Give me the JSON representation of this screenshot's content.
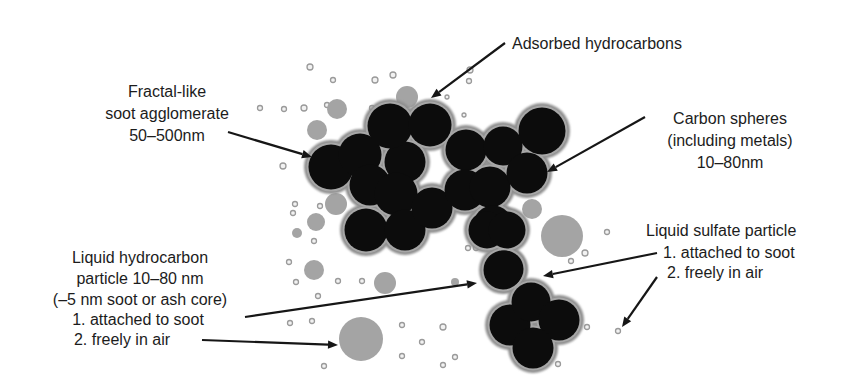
{
  "diagram": {
    "colors": {
      "background": "#ffffff",
      "soot_core": "#0c0c0c",
      "soot_halo": "#8f8f8f",
      "sphere_rim": "#a7a7a7",
      "liquid_particle": "#a4a4a4",
      "small_particle": "#9a9a9a",
      "text": "#1c1c1c",
      "arrow": "#161616"
    },
    "labels": [
      {
        "id": "agglomerate",
        "anchor": "middle",
        "x": 167,
        "lines": [
          {
            "y": 97,
            "text": "Fractal-like"
          },
          {
            "y": 119,
            "text": "soot agglomerate"
          },
          {
            "y": 141,
            "text": "50–500nm"
          }
        ]
      },
      {
        "id": "adsorbed",
        "anchor": "start",
        "x": 512,
        "lines": [
          {
            "y": 49,
            "text": "Adsorbed hydrocarbons"
          }
        ]
      },
      {
        "id": "carbon-spheres",
        "anchor": "middle",
        "x": 730,
        "lines": [
          {
            "y": 124,
            "text": "Carbon spheres"
          },
          {
            "y": 146,
            "text": "(including metals)"
          },
          {
            "y": 168,
            "text": "10–80nm"
          }
        ]
      },
      {
        "id": "sulfate",
        "anchor": "start",
        "x": 646,
        "lines": [
          {
            "y": 236,
            "text": "Liquid sulfate particle"
          },
          {
            "y": 258,
            "text": "1. attached to soot",
            "dx": 17
          },
          {
            "y": 278,
            "text": "2. freely in air",
            "dx": 21
          }
        ]
      },
      {
        "id": "liquid-hydrocarbon",
        "anchor": "middle",
        "x": 140,
        "lines": [
          {
            "y": 263,
            "text": "Liquid hydrocarbon"
          },
          {
            "y": 284,
            "text": "particle 10–80 nm"
          },
          {
            "y": 305,
            "text": "(–5 nm soot or ash core)"
          },
          {
            "y": 325,
            "text": "1. attached to soot",
            "dx": -2
          },
          {
            "y": 345,
            "text": "2. freely in air",
            "dx": -18
          }
        ]
      }
    ],
    "arrows": [
      {
        "id": "to-agglomerate",
        "x1": 228,
        "y1": 132,
        "x2": 312,
        "y2": 157
      },
      {
        "id": "to-adsorbed",
        "x1": 505,
        "y1": 43,
        "x2": 431,
        "y2": 98
      },
      {
        "id": "to-carbon-sphere",
        "x1": 645,
        "y1": 117,
        "x2": 547,
        "y2": 172
      },
      {
        "id": "to-sulfate-attached",
        "x1": 657,
        "y1": 253,
        "x2": 543,
        "y2": 276
      },
      {
        "id": "to-sulfate-free",
        "x1": 657,
        "y1": 277,
        "x2": 622,
        "y2": 327
      },
      {
        "id": "to-liquid-attached",
        "x1": 245,
        "y1": 317,
        "x2": 477,
        "y2": 283
      },
      {
        "id": "to-liquid-free",
        "x1": 202,
        "y1": 340,
        "x2": 338,
        "y2": 345
      }
    ],
    "soot_spheres": [
      {
        "cx": 331,
        "cy": 167,
        "r": 23
      },
      {
        "cx": 360,
        "cy": 155,
        "r": 22
      },
      {
        "cx": 405,
        "cy": 162,
        "r": 21
      },
      {
        "cx": 390,
        "cy": 126,
        "r": 23
      },
      {
        "cx": 430,
        "cy": 125,
        "r": 22
      },
      {
        "cx": 370,
        "cy": 185,
        "r": 21
      },
      {
        "cx": 396,
        "cy": 194,
        "r": 22
      },
      {
        "cx": 366,
        "cy": 230,
        "r": 22
      },
      {
        "cx": 405,
        "cy": 230,
        "r": 21
      },
      {
        "cx": 432,
        "cy": 208,
        "r": 21
      },
      {
        "cx": 466,
        "cy": 150,
        "r": 21
      },
      {
        "cx": 465,
        "cy": 190,
        "r": 21
      },
      {
        "cx": 490,
        "cy": 187,
        "r": 21
      },
      {
        "cx": 503,
        "cy": 146,
        "r": 20
      },
      {
        "cx": 542,
        "cy": 131,
        "r": 24
      },
      {
        "cx": 527,
        "cy": 173,
        "r": 21
      },
      {
        "cx": 493,
        "cy": 225,
        "r": 20
      },
      {
        "cx": 487,
        "cy": 230,
        "r": 19
      },
      {
        "cx": 505,
        "cy": 269,
        "r": 19
      },
      {
        "cx": 507,
        "cy": 230,
        "r": 19
      },
      {
        "cx": 503,
        "cy": 270,
        "r": 20
      },
      {
        "cx": 510,
        "cy": 325,
        "r": 21
      },
      {
        "cx": 531,
        "cy": 302,
        "r": 20
      },
      {
        "cx": 559,
        "cy": 320,
        "r": 21
      },
      {
        "cx": 533,
        "cy": 348,
        "r": 21
      }
    ],
    "liquid_particles": [
      {
        "cx": 407,
        "cy": 97,
        "r": 11
      },
      {
        "cx": 317,
        "cy": 130,
        "r": 10
      },
      {
        "cx": 337,
        "cy": 109,
        "r": 10
      },
      {
        "cx": 316,
        "cy": 222,
        "r": 9
      },
      {
        "cx": 336,
        "cy": 204,
        "r": 11
      },
      {
        "cx": 385,
        "cy": 283,
        "r": 11
      },
      {
        "cx": 361,
        "cy": 339,
        "r": 22
      },
      {
        "cx": 562,
        "cy": 236,
        "r": 21
      },
      {
        "cx": 532,
        "cy": 209,
        "r": 10
      },
      {
        "cx": 314,
        "cy": 270,
        "r": 10
      },
      {
        "cx": 455,
        "cy": 282,
        "r": 4
      },
      {
        "cx": 297,
        "cy": 233,
        "r": 5
      }
    ],
    "small_particles": [
      {
        "cx": 310,
        "cy": 67,
        "r": 3
      },
      {
        "cx": 333,
        "cy": 80,
        "r": 2.5
      },
      {
        "cx": 375,
        "cy": 80,
        "r": 3
      },
      {
        "cx": 393,
        "cy": 75,
        "r": 3
      },
      {
        "cx": 260,
        "cy": 108,
        "r": 2.5
      },
      {
        "cx": 284,
        "cy": 109,
        "r": 2.5
      },
      {
        "cx": 304,
        "cy": 108,
        "r": 3
      },
      {
        "cx": 327,
        "cy": 105,
        "r": 2.5
      },
      {
        "cx": 283,
        "cy": 166,
        "r": 3
      },
      {
        "cx": 372,
        "cy": 108,
        "r": 2.5
      },
      {
        "cx": 469,
        "cy": 81,
        "r": 2.5
      },
      {
        "cx": 470,
        "cy": 70,
        "r": 3
      },
      {
        "cx": 447,
        "cy": 97,
        "r": 2
      },
      {
        "cx": 533,
        "cy": 117,
        "r": 2
      },
      {
        "cx": 464,
        "cy": 115,
        "r": 2
      },
      {
        "cx": 295,
        "cy": 204,
        "r": 2.5
      },
      {
        "cx": 293,
        "cy": 213,
        "r": 2.5
      },
      {
        "cx": 320,
        "cy": 206,
        "r": 2.5
      },
      {
        "cx": 314,
        "cy": 241,
        "r": 2.5
      },
      {
        "cx": 289,
        "cy": 262,
        "r": 2.5
      },
      {
        "cx": 296,
        "cy": 282,
        "r": 2.5
      },
      {
        "cx": 338,
        "cy": 281,
        "r": 2.5
      },
      {
        "cx": 362,
        "cy": 281,
        "r": 2.5
      },
      {
        "cx": 318,
        "cy": 296,
        "r": 2.5
      },
      {
        "cx": 290,
        "cy": 323,
        "r": 2.5
      },
      {
        "cx": 312,
        "cy": 321,
        "r": 2.5
      },
      {
        "cx": 324,
        "cy": 366,
        "r": 2.5
      },
      {
        "cx": 402,
        "cy": 325,
        "r": 2.5
      },
      {
        "cx": 422,
        "cy": 342,
        "r": 2.5
      },
      {
        "cx": 402,
        "cy": 356,
        "r": 2.5
      },
      {
        "cx": 443,
        "cy": 327,
        "r": 3
      },
      {
        "cx": 443,
        "cy": 365,
        "r": 2.5
      },
      {
        "cx": 455,
        "cy": 357,
        "r": 2.5
      },
      {
        "cx": 607,
        "cy": 232,
        "r": 2.5
      },
      {
        "cx": 571,
        "cy": 261,
        "r": 2.5
      },
      {
        "cx": 585,
        "cy": 253,
        "r": 3
      },
      {
        "cx": 618,
        "cy": 331,
        "r": 2.5
      },
      {
        "cx": 587,
        "cy": 327,
        "r": 2.5
      },
      {
        "cx": 558,
        "cy": 364,
        "r": 2.5
      },
      {
        "cx": 468,
        "cy": 248,
        "r": 2.5
      },
      {
        "cx": 476,
        "cy": 248,
        "r": 2.5
      }
    ]
  }
}
